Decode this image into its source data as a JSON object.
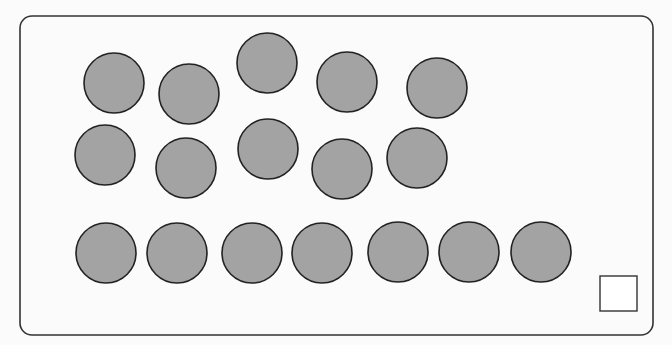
{
  "colors": {
    "background": "#fbfbfb",
    "frame_stroke": "#333333",
    "circle_fill": "#a3a3a3",
    "circle_stroke": "#222222",
    "answer_box_stroke": "#333333"
  },
  "frame": {
    "x": 20,
    "y": 16,
    "width": 633,
    "height": 319,
    "radius": 12
  },
  "answer_box": {
    "x": 600,
    "y": 276,
    "width": 37,
    "height": 35
  },
  "circle_radius": 30,
  "circle_count": 17,
  "groups": [
    {
      "name": "top-scattered-group",
      "circles": [
        {
          "cx": 114,
          "cy": 83
        },
        {
          "cx": 189,
          "cy": 94
        },
        {
          "cx": 267,
          "cy": 63
        },
        {
          "cx": 347,
          "cy": 82
        },
        {
          "cx": 437,
          "cy": 88
        },
        {
          "cx": 105,
          "cy": 155
        },
        {
          "cx": 186,
          "cy": 168
        },
        {
          "cx": 268,
          "cy": 149
        },
        {
          "cx": 342,
          "cy": 169
        },
        {
          "cx": 417,
          "cy": 158
        }
      ]
    },
    {
      "name": "bottom-row-group",
      "circles": [
        {
          "cx": 106,
          "cy": 253
        },
        {
          "cx": 177,
          "cy": 253
        },
        {
          "cx": 252,
          "cy": 253
        },
        {
          "cx": 322,
          "cy": 253
        },
        {
          "cx": 398,
          "cy": 252
        },
        {
          "cx": 469,
          "cy": 252
        },
        {
          "cx": 541,
          "cy": 252
        }
      ]
    }
  ]
}
